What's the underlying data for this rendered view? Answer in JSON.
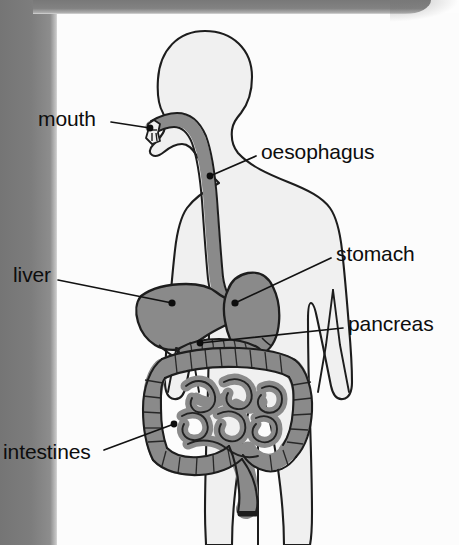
{
  "diagram": {
    "type": "labelled-anatomy-diagram",
    "view": "anterior human body silhouette with digestive organs",
    "background_color": "#fcfcfc",
    "body_fill_color": "#f0f0f0",
    "organ_fill_color": "#8a8a8a",
    "outline_color": "#1a1a1a",
    "page_edge_band_color": "#7d7d7d",
    "label_text_color": "#0d0d0d"
  },
  "labels": [
    {
      "id": "mouth",
      "text": "mouth",
      "x": 38,
      "y": 108,
      "leader_from": [
        111,
        122
      ],
      "leader_to": [
        150,
        128
      ],
      "dot": [
        150,
        128
      ]
    },
    {
      "id": "oesophagus",
      "text": "oesophagus",
      "x": 261,
      "y": 141,
      "leader_from": [
        256,
        156
      ],
      "leader_to": [
        210,
        176
      ],
      "dot": [
        210,
        176
      ]
    },
    {
      "id": "stomach",
      "text": "stomach",
      "x": 336,
      "y": 243,
      "leader_from": [
        331,
        258
      ],
      "leader_to": [
        235,
        303
      ],
      "dot": [
        235,
        303
      ]
    },
    {
      "id": "pancreas",
      "text": "pancreas",
      "x": 348,
      "y": 313,
      "leader_from": [
        343,
        328
      ],
      "leader_to": [
        200,
        343
      ],
      "dot": [
        200,
        343
      ]
    },
    {
      "id": "liver",
      "text": "liver",
      "x": 13,
      "y": 264,
      "leader_from": [
        58,
        280
      ],
      "leader_to": [
        172,
        303
      ],
      "dot": [
        172,
        303
      ]
    },
    {
      "id": "intestines",
      "text": "intestines",
      "x": 3,
      "y": 441,
      "leader_from": [
        104,
        450
      ],
      "leader_to": [
        174,
        424
      ],
      "dot": [
        174,
        424
      ]
    }
  ],
  "organs": [
    {
      "id": "mouth",
      "label": "mouth"
    },
    {
      "id": "oesophagus",
      "label": "oesophagus"
    },
    {
      "id": "stomach",
      "label": "stomach"
    },
    {
      "id": "liver",
      "label": "liver"
    },
    {
      "id": "pancreas",
      "label": "pancreas"
    },
    {
      "id": "intestines",
      "label": "intestines"
    }
  ]
}
